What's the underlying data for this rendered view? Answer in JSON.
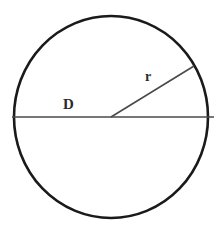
{
  "figure": {
    "kind": "geometry-diagram",
    "shape_name": "circle",
    "background_color": "#ffffff",
    "stroke_color": "#1a1a1a",
    "line_color": "#4a4a4a",
    "label_color": "#2b2b2b",
    "canvas": {
      "width": 222,
      "height": 226
    },
    "circle": {
      "center_x": 111,
      "center_y": 117,
      "radius_x": 97,
      "radius_y": 101,
      "stroke_width": 2.6
    },
    "diameter_line": {
      "x1": 12,
      "y1": 117,
      "x2": 214,
      "y2": 117,
      "stroke_width": 1.6
    },
    "radius_line": {
      "x1": 111,
      "y1": 117,
      "x2": 194,
      "y2": 66,
      "stroke_width": 1.6
    },
    "labels": {
      "diameter": "D",
      "radius": "r"
    }
  }
}
